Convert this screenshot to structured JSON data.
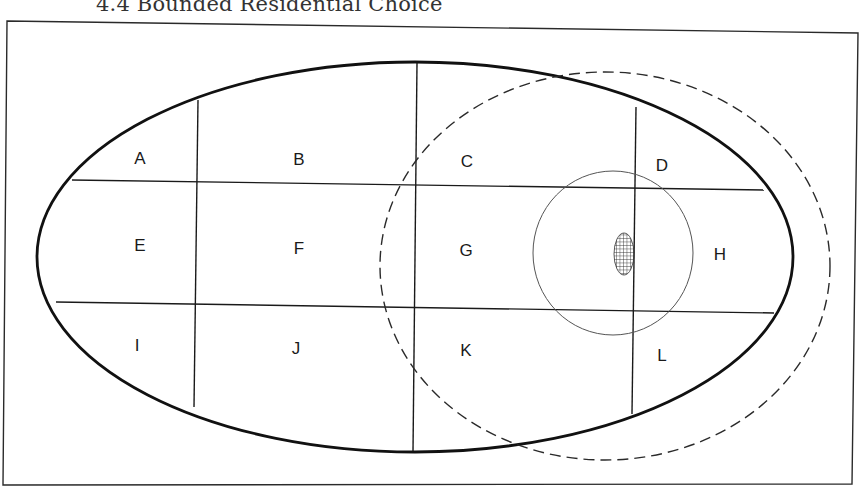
{
  "title": {
    "visible_text": "4.4 Bounded Residential Choice"
  },
  "diagram": {
    "colors": {
      "ink": "#1a1a1a",
      "thin": "#555555",
      "background": "#ffffff"
    },
    "frame": {
      "points": "7,21 858,33 852,484 3,485"
    },
    "outer_ellipse": {
      "cx": 415,
      "cy": 257,
      "rx": 378,
      "ry": 195,
      "style": "solid-thick"
    },
    "dashed_ellipse": {
      "cx": 605,
      "cy": 266,
      "rx": 225,
      "ry": 194,
      "style": "dashed"
    },
    "inner_circle": {
      "cx": 613,
      "cy": 253,
      "rx": 80,
      "ry": 82,
      "style": "solid-thin"
    },
    "hatched_area": {
      "cx": 624,
      "cy": 254,
      "rx": 10,
      "ry": 21,
      "fill": "grid-hatch"
    },
    "grid_lines": [
      {
        "name": "horizontal-line-upper",
        "x1": 72,
        "y1": 180,
        "x2": 764,
        "y2": 190
      },
      {
        "name": "horizontal-line-lower",
        "x1": 56,
        "y1": 302,
        "x2": 774,
        "y2": 313
      },
      {
        "name": "vertical-line-left",
        "x1": 198,
        "y1": 100,
        "x2": 194,
        "y2": 407
      },
      {
        "name": "vertical-line-center",
        "x1": 417,
        "y1": 63,
        "x2": 413,
        "y2": 451
      },
      {
        "name": "vertical-line-right",
        "x1": 636,
        "y1": 107,
        "x2": 632,
        "y2": 414
      }
    ],
    "zones": [
      {
        "label": "A",
        "x": 140,
        "y": 164
      },
      {
        "label": "B",
        "x": 299,
        "y": 165
      },
      {
        "label": "C",
        "x": 467,
        "y": 167
      },
      {
        "label": "D",
        "x": 662,
        "y": 171
      },
      {
        "label": "E",
        "x": 140,
        "y": 251
      },
      {
        "label": "F",
        "x": 299,
        "y": 254
      },
      {
        "label": "G",
        "x": 466,
        "y": 256
      },
      {
        "label": "H",
        "x": 720,
        "y": 260
      },
      {
        "label": "I",
        "x": 137,
        "y": 351
      },
      {
        "label": "J",
        "x": 296,
        "y": 354
      },
      {
        "label": "K",
        "x": 466,
        "y": 356
      },
      {
        "label": "L",
        "x": 662,
        "y": 361
      }
    ]
  }
}
